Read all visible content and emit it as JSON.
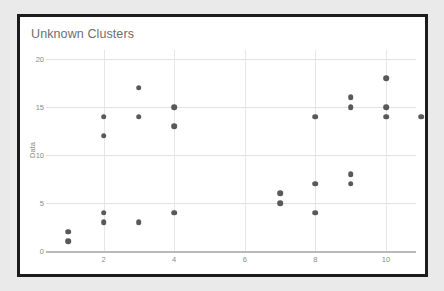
{
  "chart_data": {
    "type": "scatter",
    "title": "Unknown Clusters",
    "xlabel": "",
    "ylabel": "Data",
    "xlim": [
      0.3,
      11.5
    ],
    "ylim": [
      0,
      20.5
    ],
    "grid": true,
    "legend": false,
    "x_ticks": [
      "2",
      "4",
      "6",
      "8",
      "10"
    ],
    "x_tick_values": [
      2,
      4,
      6,
      8,
      10
    ],
    "y_ticks": [
      "0",
      "5",
      "10",
      "15",
      "20"
    ],
    "y_tick_values": [
      0,
      5,
      10,
      15,
      20
    ],
    "marker_color": "#595959",
    "points": [
      {
        "x": 1,
        "y": 2
      },
      {
        "x": 1,
        "y": 1
      },
      {
        "x": 2,
        "y": 14
      },
      {
        "x": 2,
        "y": 12
      },
      {
        "x": 2,
        "y": 4
      },
      {
        "x": 2,
        "y": 3
      },
      {
        "x": 3,
        "y": 17
      },
      {
        "x": 3,
        "y": 14
      },
      {
        "x": 3,
        "y": 3
      },
      {
        "x": 4,
        "y": 15
      },
      {
        "x": 4,
        "y": 13
      },
      {
        "x": 4,
        "y": 4
      },
      {
        "x": 7,
        "y": 6
      },
      {
        "x": 7,
        "y": 5
      },
      {
        "x": 8,
        "y": 14
      },
      {
        "x": 8,
        "y": 7
      },
      {
        "x": 8,
        "y": 4
      },
      {
        "x": 9,
        "y": 16
      },
      {
        "x": 9,
        "y": 15
      },
      {
        "x": 9,
        "y": 8
      },
      {
        "x": 9,
        "y": 7
      },
      {
        "x": 10,
        "y": 18
      },
      {
        "x": 10,
        "y": 15
      },
      {
        "x": 10,
        "y": 14
      },
      {
        "x": 11,
        "y": 14
      }
    ]
  },
  "colors": {
    "page_background": "#eaeaea",
    "card_background": "#ffffff",
    "card_border": "#1c1c1c",
    "title_text": "#6e6e6e",
    "tick_text": "#8a8a8a",
    "gridline": "#e2e2e2",
    "axis_line": "#b9b9b9",
    "marker": "#595959"
  }
}
